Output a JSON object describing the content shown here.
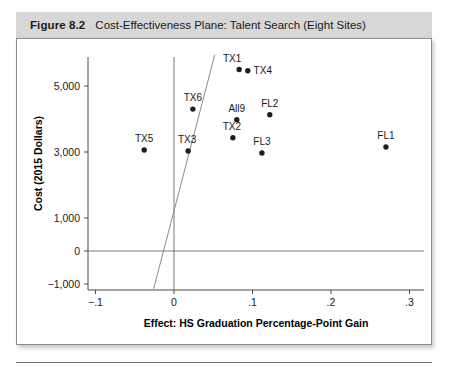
{
  "figure": {
    "label": "Figure 8.2",
    "title": "Cost-Effectiveness Plane: Talent Search (Eight Sites)"
  },
  "chart_data": {
    "type": "scatter",
    "title": "Cost-Effectiveness Plane: Talent Search (Eight Sites)",
    "xlabel": "Effect: HS Graduation Percentage-Point Gain",
    "ylabel": "Cost (2015 Dollars)",
    "xlim": [
      -0.115,
      0.33
    ],
    "ylim": [
      -1600,
      6100
    ],
    "grid": false,
    "legend": "none",
    "xticks": [
      -0.1,
      0,
      0.1,
      0.2,
      0.3
    ],
    "xticklabels": [
      "−.1",
      "0",
      ".1",
      ".2",
      ".3"
    ],
    "yticks": [
      5000,
      3000,
      1000,
      0,
      -1000
    ],
    "yticklabels": [
      "5,000",
      "3,000",
      "1,000",
      "0",
      "−1,000"
    ],
    "points": [
      {
        "label": "TX1",
        "x": 0.083,
        "y": 5500,
        "label_dx": -7,
        "label_dy": -8
      },
      {
        "label": "TX4",
        "x": 0.094,
        "y": 5460,
        "label_dx": 15,
        "label_dy": 3
      },
      {
        "label": "TX6",
        "x": 0.024,
        "y": 4300,
        "label_dx": 0,
        "label_dy": -8
      },
      {
        "label": "FL2",
        "x": 0.122,
        "y": 4130,
        "label_dx": 0,
        "label_dy": -8
      },
      {
        "label": "All9",
        "x": 0.08,
        "y": 3980,
        "label_dx": 0,
        "label_dy": -8
      },
      {
        "label": "TX2",
        "x": 0.075,
        "y": 3430,
        "label_dx": -1,
        "label_dy": -8
      },
      {
        "label": "TX5",
        "x": -0.038,
        "y": 3060,
        "label_dx": 0,
        "label_dy": -8
      },
      {
        "label": "TX3",
        "x": 0.018,
        "y": 3030,
        "label_dx": -1,
        "label_dy": -8
      },
      {
        "label": "FL3",
        "x": 0.112,
        "y": 2970,
        "label_dx": 0,
        "label_dy": -8
      },
      {
        "label": "FL1",
        "x": 0.27,
        "y": 3150,
        "label_dx": 0,
        "label_dy": -8
      }
    ],
    "reference_lines": [
      {
        "name": "zero-cost-line",
        "orientation": "horizontal",
        "value": 0
      },
      {
        "name": "zero-effect-line",
        "orientation": "vertical",
        "value": 0
      },
      {
        "name": "cost-effectiveness-threshold",
        "from": {
          "x": -0.026,
          "y": -1150
        },
        "to": {
          "x": 0.052,
          "y": 5950
        }
      }
    ]
  }
}
